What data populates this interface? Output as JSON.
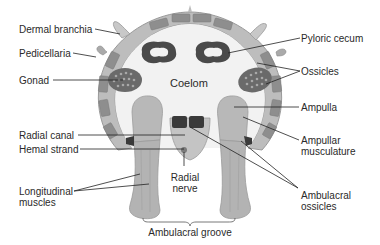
{
  "diagram": {
    "center_label": "Coelom",
    "labels_left": [
      {
        "id": "dermal-branchia",
        "text": "Dermal branchia"
      },
      {
        "id": "pedicellaria",
        "text": "Pedicellaria"
      },
      {
        "id": "gonad",
        "text": "Gonad"
      },
      {
        "id": "radial-canal",
        "text": "Radial canal"
      },
      {
        "id": "hemal-strand",
        "text": "Hemal strand"
      },
      {
        "id": "longitudinal-muscles-1",
        "text": "Longitudinal"
      },
      {
        "id": "longitudinal-muscles-2",
        "text": "muscles"
      }
    ],
    "labels_right": [
      {
        "id": "pyloric-cecum",
        "text": "Pyloric cecum"
      },
      {
        "id": "ossicles",
        "text": "Ossicles"
      },
      {
        "id": "ampulla",
        "text": "Ampulla"
      },
      {
        "id": "ampullar-musculature-1",
        "text": "Ampullar"
      },
      {
        "id": "ampullar-musculature-2",
        "text": "musculature"
      },
      {
        "id": "ambulacral-ossicles-1",
        "text": "Ambulacral"
      },
      {
        "id": "ambulacral-ossicles-2",
        "text": "ossicles"
      }
    ],
    "labels_bottom": [
      {
        "id": "radial-nerve-1",
        "text": "Radial"
      },
      {
        "id": "radial-nerve-2",
        "text": "nerve"
      },
      {
        "id": "ambulacral-groove",
        "text": "Ambulacral groove"
      }
    ],
    "colors": {
      "body_wall": "#bdbdbd",
      "plates": "#8e8e8e",
      "coelom": "#f2f2f2",
      "cecum": "#4a4a4a",
      "gonad": "#6a6a6a",
      "tube_feet": "#b3b3b3",
      "ossicle_dark": "#3a3a3a",
      "leader_line": "#222222"
    }
  }
}
